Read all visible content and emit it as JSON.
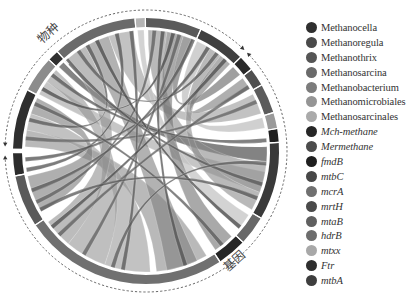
{
  "diagram": {
    "type": "chord",
    "center": [
      146,
      151
    ],
    "outer_radius": 133,
    "ring_width": 9,
    "inner_radius": 122,
    "groups": [
      {
        "id": "species",
        "label": "物种",
        "start_deg": 271,
        "end_deg": 405
      },
      {
        "id": "genes",
        "label": "基因",
        "start_deg": 45,
        "end_deg": 269
      }
    ],
    "segments": [
      {
        "name": "Methanocella",
        "group": "species",
        "start": 271,
        "end": 297,
        "color": "#2f2f2f"
      },
      {
        "name": "Methanoregula",
        "group": "species",
        "start": 297.5,
        "end": 313,
        "color": "#8c8c8c"
      },
      {
        "name": "Methanothrix",
        "group": "species",
        "start": 313.5,
        "end": 318,
        "color": "#303030"
      },
      {
        "name": "Methanosarcina",
        "group": "species",
        "start": 318.5,
        "end": 355,
        "color": "#6a6a6a"
      },
      {
        "name": "Methanobacterium",
        "group": "species",
        "start": 355.5,
        "end": 359.5,
        "color": "#b4b4b4"
      },
      {
        "name": "Methanomicrobiales",
        "group": "species",
        "start": 360,
        "end": 384,
        "color": "#5a5a5a"
      },
      {
        "name": "Methanosarcinales",
        "group": "species",
        "start": 384.5,
        "end": 405,
        "color": "#404040"
      },
      {
        "name": "Mch-methane",
        "group": "genes",
        "start": 45.5,
        "end": 52,
        "color": "#2a2a2a"
      },
      {
        "name": "Mermethane",
        "group": "genes",
        "start": 52.5,
        "end": 60,
        "color": "#505050"
      },
      {
        "name": "fmdB",
        "group": "genes",
        "start": 60.5,
        "end": 73,
        "color": "#5c5c5c"
      },
      {
        "name": "mtbC",
        "group": "genes",
        "start": 73.5,
        "end": 80,
        "color": "#9a9a9a"
      },
      {
        "name": "mcrA",
        "group": "genes",
        "start": 80.5,
        "end": 86,
        "color": "#1f1f1f"
      },
      {
        "name": "mrtH",
        "group": "genes",
        "start": 86.5,
        "end": 120,
        "color": "#3a3a3a"
      },
      {
        "name": "mtaB",
        "group": "genes",
        "start": 120.5,
        "end": 133,
        "color": "#686868"
      },
      {
        "name": "hdrB",
        "group": "genes",
        "start": 133.5,
        "end": 146,
        "color": "#262626"
      },
      {
        "name": "mtxx",
        "group": "genes",
        "start": 146.5,
        "end": 236,
        "color": "#707070"
      },
      {
        "name": "Ftr",
        "group": "genes",
        "start": 236.5,
        "end": 259,
        "color": "#5a5a5a"
      },
      {
        "name": "mtbA",
        "group": "genes",
        "start": 259.5,
        "end": 269,
        "color": "#2c2c2c"
      }
    ],
    "ribbons": [
      {
        "from": [
          272,
          280
        ],
        "to": [
          150,
          175
        ],
        "color": "#8a8a8a"
      },
      {
        "from": [
          280,
          288
        ],
        "to": [
          178,
          200
        ],
        "color": "#9a9a9a"
      },
      {
        "from": [
          288,
          296
        ],
        "to": [
          240,
          258
        ],
        "color": "#7a7a7a"
      },
      {
        "from": [
          298,
          305
        ],
        "to": [
          100,
          110
        ],
        "color": "#a0a0a0"
      },
      {
        "from": [
          305,
          312
        ],
        "to": [
          200,
          220
        ],
        "color": "#959595"
      },
      {
        "from": [
          314,
          317
        ],
        "to": [
          88,
          95
        ],
        "color": "#5a5a5a"
      },
      {
        "from": [
          319,
          330
        ],
        "to": [
          220,
          234
        ],
        "color": "#8f8f8f"
      },
      {
        "from": [
          330,
          342
        ],
        "to": [
          155,
          170
        ],
        "color": "#7f7f7f"
      },
      {
        "from": [
          342,
          354
        ],
        "to": [
          62,
          72
        ],
        "color": "#9a9a9a"
      },
      {
        "from": [
          356,
          359
        ],
        "to": [
          122,
          130
        ],
        "color": "#c4c4c4"
      },
      {
        "from": [
          361,
          370
        ],
        "to": [
          96,
          110
        ],
        "color": "#8a8a8a"
      },
      {
        "from": [
          370,
          378
        ],
        "to": [
          135,
          145
        ],
        "color": "#707070"
      },
      {
        "from": [
          378,
          383
        ],
        "to": [
          46,
          51
        ],
        "color": "#606060"
      },
      {
        "from": [
          385,
          392
        ],
        "to": [
          74,
          79
        ],
        "color": "#b0b0b0"
      },
      {
        "from": [
          392,
          398
        ],
        "to": [
          110,
          119
        ],
        "color": "#8a8a8a"
      },
      {
        "from": [
          398,
          404
        ],
        "to": [
          53,
          59
        ],
        "color": "#7a7a7a"
      },
      {
        "from": [
          284,
          286
        ],
        "to": [
          330,
          332
        ],
        "color": "#555555"
      },
      {
        "from": [
          300,
          302
        ],
        "to": [
          372,
          374
        ],
        "color": "#4a4a4a"
      },
      {
        "from": [
          325,
          327
        ],
        "to": [
          395,
          397
        ],
        "color": "#5a5a5a"
      },
      {
        "from": [
          345,
          347
        ],
        "to": [
          260,
          262
        ],
        "color": "#505050"
      },
      {
        "from": [
          363,
          365
        ],
        "to": [
          244,
          246
        ],
        "color": "#5d5d5d"
      },
      {
        "from": [
          390,
          392
        ],
        "to": [
          265,
          267
        ],
        "color": "#4f4f4f"
      },
      {
        "from": [
          275,
          277
        ],
        "to": [
          65,
          67
        ],
        "color": "#606060"
      },
      {
        "from": [
          308,
          310
        ],
        "to": [
          84,
          86
        ],
        "color": "#555555"
      },
      {
        "from": [
          335,
          337
        ],
        "to": [
          128,
          130
        ],
        "color": "#4a4a4a"
      },
      {
        "from": [
          352,
          354
        ],
        "to": [
          190,
          192
        ],
        "color": "#565656"
      },
      {
        "from": [
          375,
          377
        ],
        "to": [
          210,
          212
        ],
        "color": "#5f5f5f"
      },
      {
        "from": [
          400,
          402
        ],
        "to": [
          230,
          232
        ],
        "color": "#4c4c4c"
      },
      {
        "from": [
          292,
          294
        ],
        "to": [
          140,
          142
        ],
        "color": "#5a5a5a"
      },
      {
        "from": [
          318,
          320
        ],
        "to": [
          105,
          107
        ],
        "color": "#565656"
      },
      {
        "from": [
          367,
          369
        ],
        "to": [
          160,
          162
        ],
        "color": "#4f4f4f"
      },
      {
        "from": [
          382,
          384
        ],
        "to": [
          250,
          252
        ],
        "color": "#575757"
      },
      {
        "from": [
          57,
          59
        ],
        "to": [
          225,
          227
        ],
        "color": "#5c5c5c"
      },
      {
        "from": [
          95,
          97
        ],
        "to": [
          195,
          197
        ],
        "color": "#595959"
      },
      {
        "from": [
          112,
          114
        ],
        "to": [
          240,
          242
        ],
        "color": "#545454"
      }
    ],
    "dashed_arcs": [
      {
        "group": "species",
        "start_deg": 273,
        "end_deg": 403,
        "radius": 141
      },
      {
        "group": "genes",
        "start_deg": 47,
        "end_deg": 267,
        "radius": 141
      }
    ]
  },
  "legend": {
    "items": [
      {
        "label": "Methanocella",
        "color": "#2f2f2f",
        "italic": false
      },
      {
        "label": "Methanoregula",
        "color": "#4a4a4a",
        "italic": false
      },
      {
        "label": "Methanothrix",
        "color": "#555555",
        "italic": false
      },
      {
        "label": "Methanosarcina",
        "color": "#6a6a6a",
        "italic": false
      },
      {
        "label": "Methanobacterium",
        "color": "#7c7c7c",
        "italic": false
      },
      {
        "label": "Methanomicrobiales",
        "color": "#959595",
        "italic": false
      },
      {
        "label": "Methanosarcinales",
        "color": "#aaaaaa",
        "italic": false
      },
      {
        "label": "Mch-methane",
        "color": "#262626",
        "italic": true
      },
      {
        "label": "Mermethane",
        "color": "#4c4c4c",
        "italic": true
      },
      {
        "label": "fmdB",
        "color": "#1f1f1f",
        "italic": true
      },
      {
        "label": "mtbC",
        "color": "#474747",
        "italic": true
      },
      {
        "label": "mcrA",
        "color": "#707070",
        "italic": true
      },
      {
        "label": "mrtH",
        "color": "#4a4a4a",
        "italic": true
      },
      {
        "label": "mtaB",
        "color": "#606060",
        "italic": true
      },
      {
        "label": "hdrB",
        "color": "#6c6c6c",
        "italic": true
      },
      {
        "label": "mtxx",
        "color": "#a8a8a8",
        "italic": true
      },
      {
        "label": "Ftr",
        "color": "#2e2e2e",
        "italic": true
      },
      {
        "label": "mtbA",
        "color": "#3e3e3e",
        "italic": true
      }
    ]
  },
  "labels": {
    "species_group": "物种",
    "gene_group": "基因"
  }
}
